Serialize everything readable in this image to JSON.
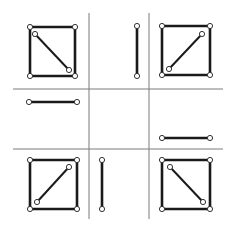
{
  "diagram": {
    "colors": {
      "grid": "#7a7a7a",
      "stroke": "#1a1a1a",
      "node_fill": "#ffffff",
      "background": "#ffffff"
    },
    "grid": {
      "x_range": [
        13,
        223
      ],
      "y_range": [
        13,
        219
      ],
      "vertical_lines_x": [
        89,
        149
      ],
      "horizontal_lines_y": [
        89,
        149
      ]
    },
    "cells": [
      {
        "position": "top-left",
        "shape": "square",
        "rect": [
          30,
          27,
          75,
          76
        ],
        "diagonal": [
          [
            35,
            34
          ],
          [
            69,
            70
          ]
        ]
      },
      {
        "position": "top-center",
        "shape": "vertical-segment",
        "segment": [
          [
            137,
            26
          ],
          [
            137,
            76
          ]
        ]
      },
      {
        "position": "top-right",
        "shape": "square",
        "rect": [
          162,
          26,
          210,
          75
        ],
        "diagonal": [
          [
            169,
            69
          ],
          [
            202,
            34
          ]
        ]
      },
      {
        "position": "middle-left",
        "shape": "horizontal-segment",
        "segment": [
          [
            29,
            102
          ],
          [
            77,
            102
          ]
        ]
      },
      {
        "position": "center",
        "shape": "empty"
      },
      {
        "position": "middle-right",
        "shape": "horizontal-segment",
        "segment": [
          [
            162,
            138
          ],
          [
            210,
            138
          ]
        ]
      },
      {
        "position": "bottom-left",
        "shape": "square",
        "rect": [
          30,
          160,
          77,
          209
        ],
        "diagonal": [
          [
            37,
            202
          ],
          [
            69,
            167
          ]
        ]
      },
      {
        "position": "bottom-center",
        "shape": "vertical-segment",
        "segment": [
          [
            102,
            160
          ],
          [
            102,
            209
          ]
        ]
      },
      {
        "position": "bottom-right",
        "shape": "square",
        "rect": [
          162,
          160,
          210,
          209
        ],
        "diagonal": [
          [
            170,
            167
          ],
          [
            203,
            202
          ]
        ]
      }
    ]
  }
}
